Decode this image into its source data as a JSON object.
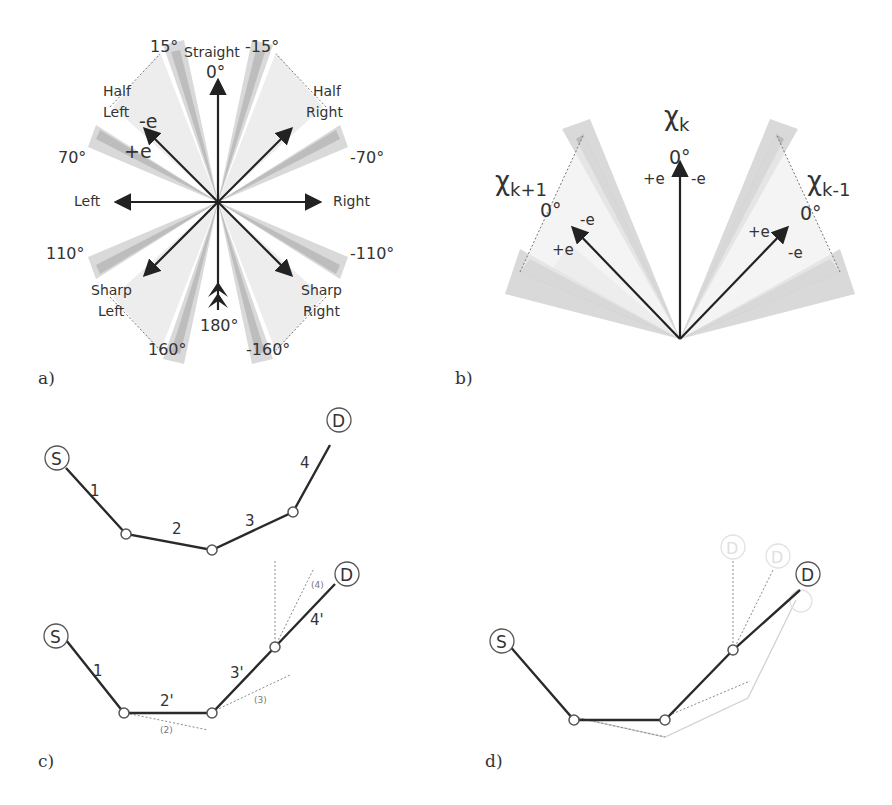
{
  "panel_a": {
    "label": "a)",
    "directions": {
      "straight": "Straight",
      "half_left": [
        "Half",
        "Left"
      ],
      "half_right": [
        "Half",
        "Right"
      ],
      "left": "Left",
      "right": "Right",
      "sharp_left": [
        "Sharp",
        "Left"
      ],
      "sharp_right": [
        "Sharp",
        "Right"
      ]
    },
    "angles": {
      "a0": "0°",
      "a15": "15°",
      "am15": "-15°",
      "a70": "70°",
      "am70": "-70°",
      "a110": "110°",
      "am110": "-110°",
      "a160": "160°",
      "am160": "-160°",
      "a180": "180°"
    },
    "error": {
      "minus": "-e",
      "plus": "+e"
    }
  },
  "panel_b": {
    "label": "b)",
    "chi_k": "χ",
    "chi_k_sub": "k",
    "chi_k1": "χ",
    "chi_k1_sub": "k+1",
    "chi_km1": "χ",
    "chi_km1_sub": "k-1",
    "zero": "0°",
    "plus_e": "+e",
    "minus_e": "-e"
  },
  "panel_c": {
    "label": "c)",
    "source": "S",
    "dest": "D",
    "segments_top": [
      "1",
      "2",
      "3",
      "4"
    ],
    "segments_bottom": [
      "1",
      "2'",
      "3'",
      "4'"
    ],
    "ghost_segments": [
      "(2)",
      "(3)",
      "(4)"
    ]
  },
  "panel_d": {
    "label": "d)",
    "source": "S",
    "dest": "D",
    "ghost_dest": "D"
  },
  "colors": {
    "light_fill": "#ececec",
    "mid_fill": "#d3d3d3",
    "dark_fill": "#b9b9b9",
    "line": "#2a2a2a",
    "ghost": "#c8c8c8"
  }
}
